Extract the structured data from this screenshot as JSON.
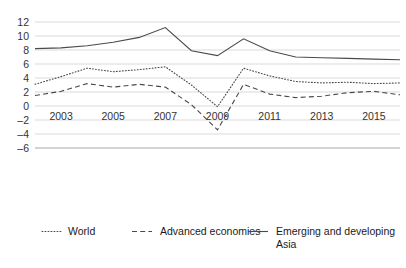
{
  "chart_data": {
    "type": "line",
    "title": "",
    "subtitle": "",
    "xlabel": "",
    "ylabel": "",
    "x": [
      2002,
      2003,
      2004,
      2005,
      2006,
      2007,
      2008,
      2009,
      2010,
      2011,
      2012,
      2013,
      2014,
      2015,
      2016
    ],
    "xtick_labels": [
      "2003",
      "2005",
      "2007",
      "2009",
      "2011",
      "2013",
      "2015"
    ],
    "xtick_values": [
      2003,
      2005,
      2007,
      2009,
      2011,
      2013,
      2015
    ],
    "ytick_labels": [
      "12",
      "10",
      "8",
      "6",
      "4",
      "2",
      "0",
      "–2",
      "–4",
      "–6"
    ],
    "ytick_values": [
      12,
      10,
      8,
      6,
      4,
      2,
      0,
      -2,
      -4,
      -6
    ],
    "xlim": [
      2002,
      2016
    ],
    "ylim": [
      -6,
      12
    ],
    "grid": true,
    "legend_position": "bottom",
    "series": [
      {
        "name": "World",
        "style": "dotted",
        "color": "#4a4a4a",
        "values": [
          3.1,
          4.2,
          5.4,
          4.9,
          5.2,
          5.6,
          3.0,
          -0.1,
          5.4,
          4.3,
          3.5,
          3.3,
          3.4,
          3.2,
          3.3
        ]
      },
      {
        "name": "Advanced economies",
        "style": "dashed",
        "color": "#4a4a4a",
        "values": [
          1.5,
          2.1,
          3.2,
          2.7,
          3.1,
          2.7,
          0.2,
          -3.4,
          3.1,
          1.7,
          1.2,
          1.4,
          1.9,
          2.1,
          1.6
        ]
      },
      {
        "name": "Emerging and developing Asia",
        "style": "solid",
        "color": "#4a4a4a",
        "values": [
          8.2,
          8.3,
          8.6,
          9.1,
          9.8,
          11.2,
          7.9,
          7.2,
          9.6,
          7.9,
          7.0,
          6.9,
          6.8,
          6.7,
          6.6
        ]
      }
    ]
  },
  "legend": {
    "items": [
      {
        "label": "World",
        "style": "dotted"
      },
      {
        "label": "Advanced economies",
        "style": "dashed"
      },
      {
        "label": "Emerging and developing",
        "label2": "Asia",
        "style": "solid"
      }
    ]
  }
}
